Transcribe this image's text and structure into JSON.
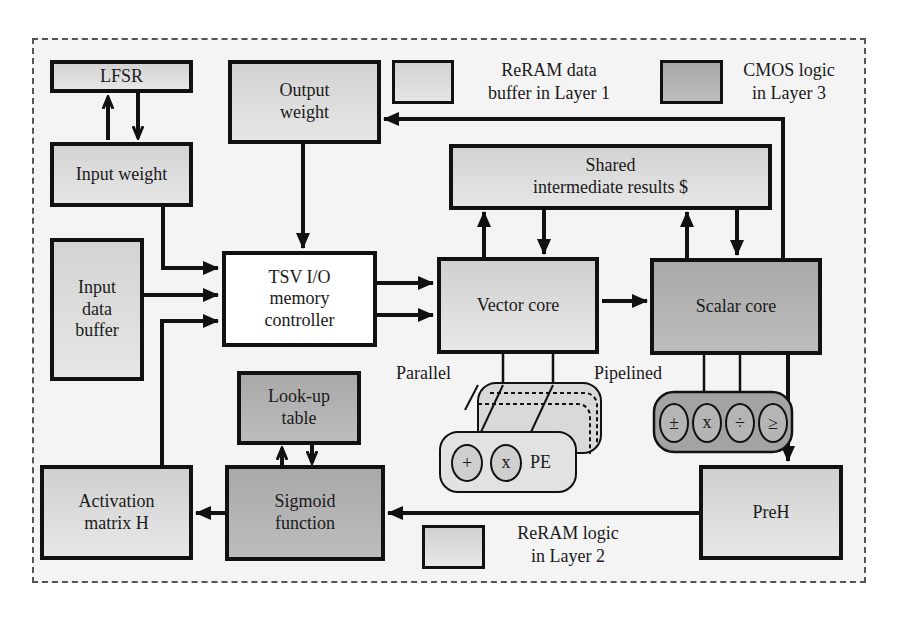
{
  "diagram": {
    "blocks": {
      "lfsr": "LFSR",
      "output_weight": "Output\nweight",
      "input_weight": "Input weight",
      "shared_results": "Shared\nintermediate results $",
      "input_data_buffer": "Input\ndata\nbuffer",
      "tsv_controller": "TSV I/O\nmemory\ncontroller",
      "vector_core": "Vector core",
      "scalar_core": "Scalar core",
      "lookup_table": "Look-up\ntable",
      "activation_matrix": "Activation\nmatrix H",
      "sigmoid": "Sigmoid\nfunction",
      "preh": "PreH",
      "pe": "PE"
    },
    "annotations": {
      "parallel": "Parallel",
      "pipelined": "Pipelined"
    },
    "pe_ops": [
      "+",
      "x"
    ],
    "scalar_ops": [
      "±",
      "x",
      "÷",
      "≥"
    ],
    "legend": {
      "reram_buffer": "ReRAM data\nbuffer in Layer 1",
      "cmos_logic": "CMOS logic\nin Layer 3",
      "reram_logic": "ReRAM logic\nin Layer 2"
    },
    "colors": {
      "layer1_buffer": "#dcdcdc",
      "layer2_logic": "#dcdcdc",
      "layer3_cmos": "#b0b0b0",
      "io_controller": "#ffffff",
      "line": "#111111"
    }
  }
}
